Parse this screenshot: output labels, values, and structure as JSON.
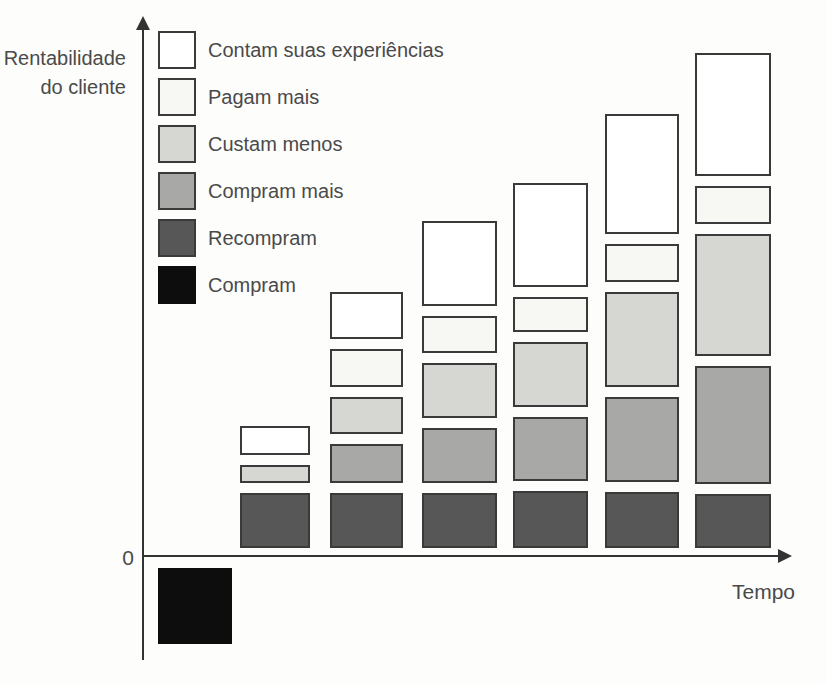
{
  "axes": {
    "ylabel_line1": "Rentabilidade",
    "ylabel_line2": "do cliente",
    "xlabel": "Tempo",
    "origin_label": "0"
  },
  "legend": {
    "items": [
      {
        "label": "Contam suas experiências",
        "color_key": "white"
      },
      {
        "label": "Pagam mais",
        "color_key": "off_white"
      },
      {
        "label": "Custam menos",
        "color_key": "light_gray"
      },
      {
        "label": "Compram mais",
        "color_key": "medium_gray"
      },
      {
        "label": "Recompram",
        "color_key": "dark_gray"
      },
      {
        "label": "Compram",
        "color_key": "black"
      }
    ]
  },
  "colors": {
    "white": "#ffffff",
    "off_white": "#f7f7f4",
    "light_gray": "#d6d6d3",
    "medium_gray": "#a8a8a6",
    "dark_gray": "#575757",
    "black": "#0d0d0d",
    "border": "#3a3a3a",
    "axis": "#333333",
    "text": "#4a4a4a"
  },
  "chart_data": {
    "type": "bar",
    "stacked": true,
    "orientation": "vertical",
    "xlabel": "Tempo",
    "ylabel": "Rentabilidade do cliente",
    "x": [
      1,
      2,
      3,
      4,
      5,
      6,
      7
    ],
    "axis_has_numeric_scale": false,
    "units": "estimated pixel heights (figure prints no numeric scale)",
    "legend_position": "top-left",
    "series": [
      {
        "name": "Compram",
        "color_key": "black",
        "position": "below-axis",
        "values": [
          -76,
          null,
          null,
          null,
          null,
          null,
          null
        ]
      },
      {
        "name": "Recompram",
        "color_key": "dark_gray",
        "values": [
          null,
          55,
          55,
          55,
          57,
          56,
          54
        ]
      },
      {
        "name": "Compram mais",
        "color_key": "medium_gray",
        "values": [
          null,
          null,
          39,
          55,
          64,
          85,
          118
        ]
      },
      {
        "name": "Custam menos",
        "color_key": "light_gray",
        "values": [
          null,
          18,
          37,
          55,
          65,
          95,
          122
        ]
      },
      {
        "name": "Pagam mais",
        "color_key": "off_white",
        "values": [
          null,
          null,
          38,
          37,
          35,
          38,
          38
        ]
      },
      {
        "name": "Contam suas experiências",
        "color_key": "white",
        "values": [
          null,
          29,
          47,
          85,
          104,
          120,
          123
        ]
      }
    ],
    "layout": {
      "baseline_y": 548,
      "axis_y": 556,
      "segment_gap": 10,
      "below_axis_gap": 12,
      "columns": [
        {
          "x": 158,
          "w": 74
        },
        {
          "x": 240,
          "w": 70
        },
        {
          "x": 330,
          "w": 73
        },
        {
          "x": 422,
          "w": 75
        },
        {
          "x": 513,
          "w": 75
        },
        {
          "x": 605,
          "w": 74
        },
        {
          "x": 695,
          "w": 76
        }
      ],
      "legend": {
        "x": 158,
        "top": 30,
        "row_h": 47
      }
    }
  }
}
